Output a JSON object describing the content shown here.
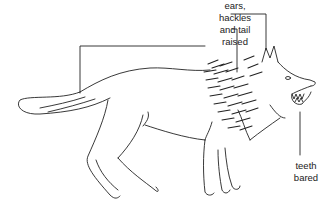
{
  "figure": {
    "labels": {
      "top": [
        "ears,",
        "hackles",
        "and tail",
        "raised"
      ],
      "teeth": [
        "teeth",
        "bared"
      ]
    },
    "colors": {
      "line": "#222222",
      "background": "#ffffff"
    }
  }
}
